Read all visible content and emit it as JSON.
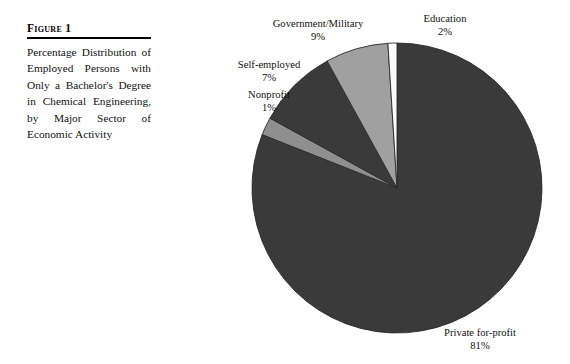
{
  "figure": {
    "heading": "Figure 1",
    "caption": "Percentage Distribution of Employed Persons with Only a Bachelor's Degree in Chemical Engineering, by Major Sector of Economic Activity"
  },
  "chart_data": {
    "type": "pie",
    "title": "Percentage Distribution of Employed Persons with Only a Bachelor's Degree in Chemical Engineering, by Major Sector of Economic Activity",
    "xlabel": "",
    "ylabel": "",
    "units": "percent",
    "start_angle_deg": 0,
    "direction": "clockwise",
    "legend": "none",
    "grid": false,
    "categories": [
      "Private for-profit",
      "Education",
      "Government/Military",
      "Self-employed",
      "Nonprofit"
    ],
    "values": [
      81,
      2,
      9,
      7,
      1
    ],
    "labels": [
      {
        "name": "Private for-profit",
        "pct": "81%",
        "value": 81,
        "color": "#3a3a3a"
      },
      {
        "name": "Education",
        "pct": "2%",
        "value": 2,
        "color": "#8f8f8f"
      },
      {
        "name": "Government/Military",
        "pct": "9%",
        "value": 9,
        "color": "#3a3a3a"
      },
      {
        "name": "Self-employed",
        "pct": "7%",
        "value": 7,
        "color": "#a0a0a0"
      },
      {
        "name": "Nonprofit",
        "pct": "1%",
        "value": 1,
        "color": "#fbfbfb"
      }
    ],
    "colors": {
      "dark_slice": "#3a3a3a",
      "mid_slice": "#8f8f8f",
      "light_slice": "#a0a0a0",
      "white_slice": "#fbfbfb",
      "outline": "#2a2a2a",
      "background": "#ffffff"
    }
  }
}
